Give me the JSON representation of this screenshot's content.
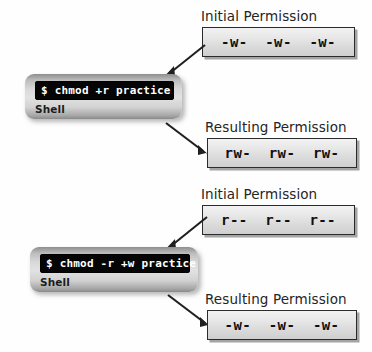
{
  "blocks": [
    {
      "heading": "Initial Permission",
      "permission": "-w-  -w-  -w-",
      "role": "initial"
    },
    {
      "shell": {
        "command": "$ chmod +r practice",
        "label": "Shell"
      }
    },
    {
      "heading": "Resulting Permission",
      "permission": "rw-  rw-  rw-",
      "role": "resulting"
    },
    {
      "heading": "Initial Permission",
      "permission": "r--  r--  r--",
      "role": "initial"
    },
    {
      "shell": {
        "command": "$ chmod -r +w practice",
        "label": "Shell"
      }
    },
    {
      "heading": "Resulting Permission",
      "permission": "-w-  -w-  -w-",
      "role": "resulting"
    }
  ],
  "headings": {
    "initial_1": "Initial Permission",
    "resulting_1": "Resulting Permission",
    "initial_2": "Initial Permission",
    "resulting_2": "Resulting Permission"
  },
  "permissions": {
    "initial_1": "-w-  -w-  -w-",
    "resulting_1": "rw-  rw-  rw-",
    "initial_2": "r--  r--  r--",
    "resulting_2": "-w-  -w-  -w-"
  },
  "shells": {
    "first": {
      "command": "$ chmod +r practice",
      "label": "Shell"
    },
    "second": {
      "command": "$ chmod -r +w practice",
      "label": "Shell"
    }
  },
  "colors": {
    "background": "#fefefe",
    "box_border": "#2b2b2b",
    "box_fill_top": "#f2f2f2",
    "box_fill_bottom": "#cfcfcf",
    "terminal_bg": "#050505",
    "terminal_text": "#ffffff",
    "heading_text": "#252525",
    "arrow": "#1f1f1f"
  },
  "arrows": [
    {
      "name": "arrow-initial1-to-shell1",
      "direction": "down-left"
    },
    {
      "name": "arrow-shell1-to-resulting1",
      "direction": "down-right"
    },
    {
      "name": "arrow-initial2-to-shell2",
      "direction": "down-left"
    },
    {
      "name": "arrow-shell2-to-resulting2",
      "direction": "down-right"
    }
  ]
}
